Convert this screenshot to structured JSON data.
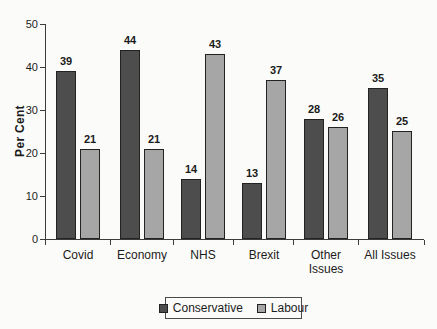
{
  "chart_data": {
    "type": "bar",
    "title": "",
    "xlabel": "",
    "ylabel": "Per Cent",
    "ylim": [
      0,
      50
    ],
    "yticks": [
      0,
      10,
      20,
      30,
      40,
      50
    ],
    "grid": false,
    "value_labels": true,
    "legend_position": "bottom",
    "categories": [
      "Covid",
      "Economy",
      "NHS",
      "Brexit",
      "Other Issues",
      "All Issues"
    ],
    "category_label_lines": [
      [
        "Covid"
      ],
      [
        "Economy"
      ],
      [
        "NHS"
      ],
      [
        "Brexit"
      ],
      [
        "Other",
        "Issues"
      ],
      [
        "All Issues"
      ]
    ],
    "series": [
      {
        "name": "Conservative",
        "color": "#4d4d4d",
        "values": [
          39,
          44,
          14,
          13,
          28,
          35
        ]
      },
      {
        "name": "Labour",
        "color": "#a6a6a6",
        "values": [
          21,
          21,
          43,
          37,
          26,
          25
        ]
      }
    ]
  },
  "colors": {
    "axis": "#3c3c3c",
    "bar_border": "#222222",
    "text": "#1b1b1b",
    "background": "#fbfbfa"
  }
}
